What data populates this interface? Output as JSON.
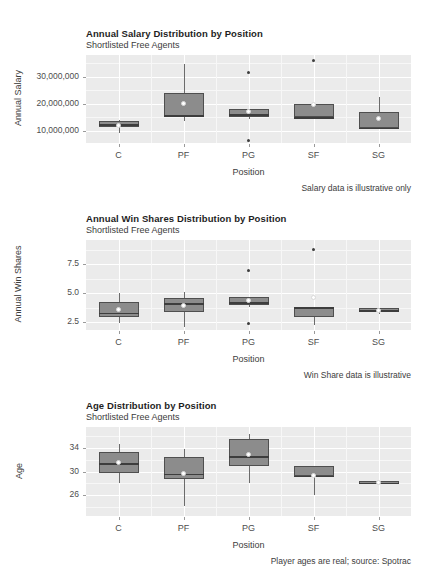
{
  "page": {
    "background": "#ffffff",
    "panel_background": "#ebebeb",
    "box_fill": "#8c8c8c",
    "box_outline": "#4f4f4f",
    "mean_point_color": "#ffffff",
    "grid_color": "#ffffff"
  },
  "charts": [
    {
      "id": "salary",
      "title": "Annual Salary Distribution by Position",
      "subtitle": "Shortlisted Free Agents",
      "caption": "Salary data is illustrative only",
      "xlabel": "Position",
      "ylabel": "Annual Salary",
      "categories": [
        "C",
        "PF",
        "PG",
        "SF",
        "SG"
      ],
      "ytick_labels": [
        "30,000,000",
        "20,000,000",
        "10,000,000"
      ],
      "ytick_values": [
        30000000,
        20000000,
        10000000
      ],
      "ylim": [
        5500000,
        38000000
      ],
      "chart_data": {
        "type": "box",
        "title": "Annual Salary Distribution by Position",
        "subtitle": "Shortlisted Free Agents",
        "xlabel": "Position",
        "ylabel": "Annual Salary",
        "categories": [
          "C",
          "PF",
          "PG",
          "SF",
          "SG"
        ],
        "ylim": [
          5500000,
          38000000
        ],
        "grid": true,
        "legend": "none",
        "boxes": [
          {
            "category": "C",
            "lower_whisker": 9200000,
            "q1": 11400000,
            "median": 12400000,
            "q3": 13800000,
            "upper_whisker": 14000000,
            "mean": 11900000,
            "outliers": []
          },
          {
            "category": "PF",
            "lower_whisker": 13800000,
            "q1": 15400000,
            "median": 15700000,
            "q3": 23900000,
            "upper_whisker": 34800000,
            "mean": 20200000,
            "outliers": []
          },
          {
            "category": "PG",
            "lower_whisker": 14500000,
            "q1": 15000000,
            "median": 16200000,
            "q3": 18200000,
            "upper_whisker": 18200000,
            "mean": 17200000,
            "outliers": [
              31600000,
              6400000
            ]
          },
          {
            "category": "SF",
            "lower_whisker": 14200000,
            "q1": 15000000,
            "median": 15100000,
            "q3": 19800000,
            "upper_whisker": 19800000,
            "mean": 19600000,
            "outliers": [
              35900000
            ]
          },
          {
            "category": "SG",
            "lower_whisker": 11000000,
            "q1": 11000000,
            "median": 11200000,
            "q3": 16800000,
            "upper_whisker": 22600000,
            "mean": 14700000,
            "outliers": []
          }
        ]
      }
    },
    {
      "id": "winshares",
      "title": "Annual Win Shares Distribution by Position",
      "subtitle": "Shortlisted Free Agents",
      "caption": "Win Share data is illustrative",
      "xlabel": "Position",
      "ylabel": "Annual Win Shares",
      "categories": [
        "C",
        "PF",
        "PG",
        "SF",
        "SG"
      ],
      "ytick_labels": [
        "7.5",
        "5.0",
        "2.5"
      ],
      "ytick_values": [
        7.5,
        5.0,
        2.5
      ],
      "ylim": [
        1.8,
        9.6
      ],
      "chart_data": {
        "type": "box",
        "title": "Annual Win Shares Distribution by Position",
        "subtitle": "Shortlisted Free Agents",
        "xlabel": "Position",
        "ylabel": "Annual Win Shares",
        "categories": [
          "C",
          "PF",
          "PG",
          "SF",
          "SG"
        ],
        "ylim": [
          1.8,
          9.6
        ],
        "grid": true,
        "legend": "none",
        "boxes": [
          {
            "category": "C",
            "lower_whisker": 2.4,
            "q1": 2.9,
            "median": 3.3,
            "q3": 4.2,
            "upper_whisker": 5.0,
            "mean": 3.6,
            "outliers": []
          },
          {
            "category": "PF",
            "lower_whisker": 2.1,
            "q1": 3.4,
            "median": 4.1,
            "q3": 4.6,
            "upper_whisker": 5.1,
            "mean": 3.9,
            "outliers": []
          },
          {
            "category": "PG",
            "lower_whisker": 3.8,
            "q1": 4.0,
            "median": 4.2,
            "q3": 4.7,
            "upper_whisker": 4.7,
            "mean": 4.4,
            "outliers": [
              7.0,
              2.4
            ]
          },
          {
            "category": "SF",
            "lower_whisker": 2.2,
            "q1": 2.9,
            "median": 3.8,
            "q3": 3.8,
            "upper_whisker": 3.8,
            "mean": 4.6,
            "outliers": [
              8.8
            ]
          },
          {
            "category": "SG",
            "lower_whisker": 3.2,
            "q1": 3.4,
            "median": 3.5,
            "q3": 3.7,
            "upper_whisker": 3.7,
            "mean": 3.5,
            "outliers": []
          }
        ]
      }
    },
    {
      "id": "age",
      "title": "Age Distribution by Position",
      "subtitle": "Shortlisted Free Agents",
      "caption": "Player ages are real; source: Spotrac",
      "xlabel": "Position",
      "ylabel": "Age",
      "categories": [
        "C",
        "PF",
        "PG",
        "SF",
        "SG"
      ],
      "ytick_labels": [
        "34",
        "30",
        "26"
      ],
      "ytick_values": [
        34,
        30,
        26
      ],
      "ylim": [
        22.5,
        37.5
      ],
      "chart_data": {
        "type": "box",
        "title": "Age Distribution by Position",
        "subtitle": "Shortlisted Free Agents",
        "xlabel": "Position",
        "ylabel": "Age",
        "categories": [
          "C",
          "PF",
          "PG",
          "SF",
          "SG"
        ],
        "ylim": [
          22.5,
          37.5
        ],
        "grid": true,
        "legend": "none",
        "boxes": [
          {
            "category": "C",
            "lower_whisker": 28.0,
            "q1": 29.7,
            "median": 31.4,
            "q3": 33.3,
            "upper_whisker": 34.6,
            "mean": 31.5,
            "outliers": []
          },
          {
            "category": "PF",
            "lower_whisker": 24.2,
            "q1": 28.8,
            "median": 29.6,
            "q3": 32.5,
            "upper_whisker": 33.8,
            "mean": 29.7,
            "outliers": []
          },
          {
            "category": "PG",
            "lower_whisker": 28.0,
            "q1": 30.9,
            "median": 32.6,
            "q3": 35.4,
            "upper_whisker": 36.3,
            "mean": 32.9,
            "outliers": []
          },
          {
            "category": "SF",
            "lower_whisker": 26.1,
            "q1": 29.3,
            "median": 29.3,
            "q3": 31.0,
            "upper_whisker": 31.0,
            "mean": 29.4,
            "outliers": []
          },
          {
            "category": "SG",
            "lower_whisker": 27.9,
            "q1": 27.9,
            "median": 28.1,
            "q3": 28.4,
            "upper_whisker": 28.4,
            "mean": 28.1,
            "outliers": []
          }
        ]
      }
    }
  ]
}
